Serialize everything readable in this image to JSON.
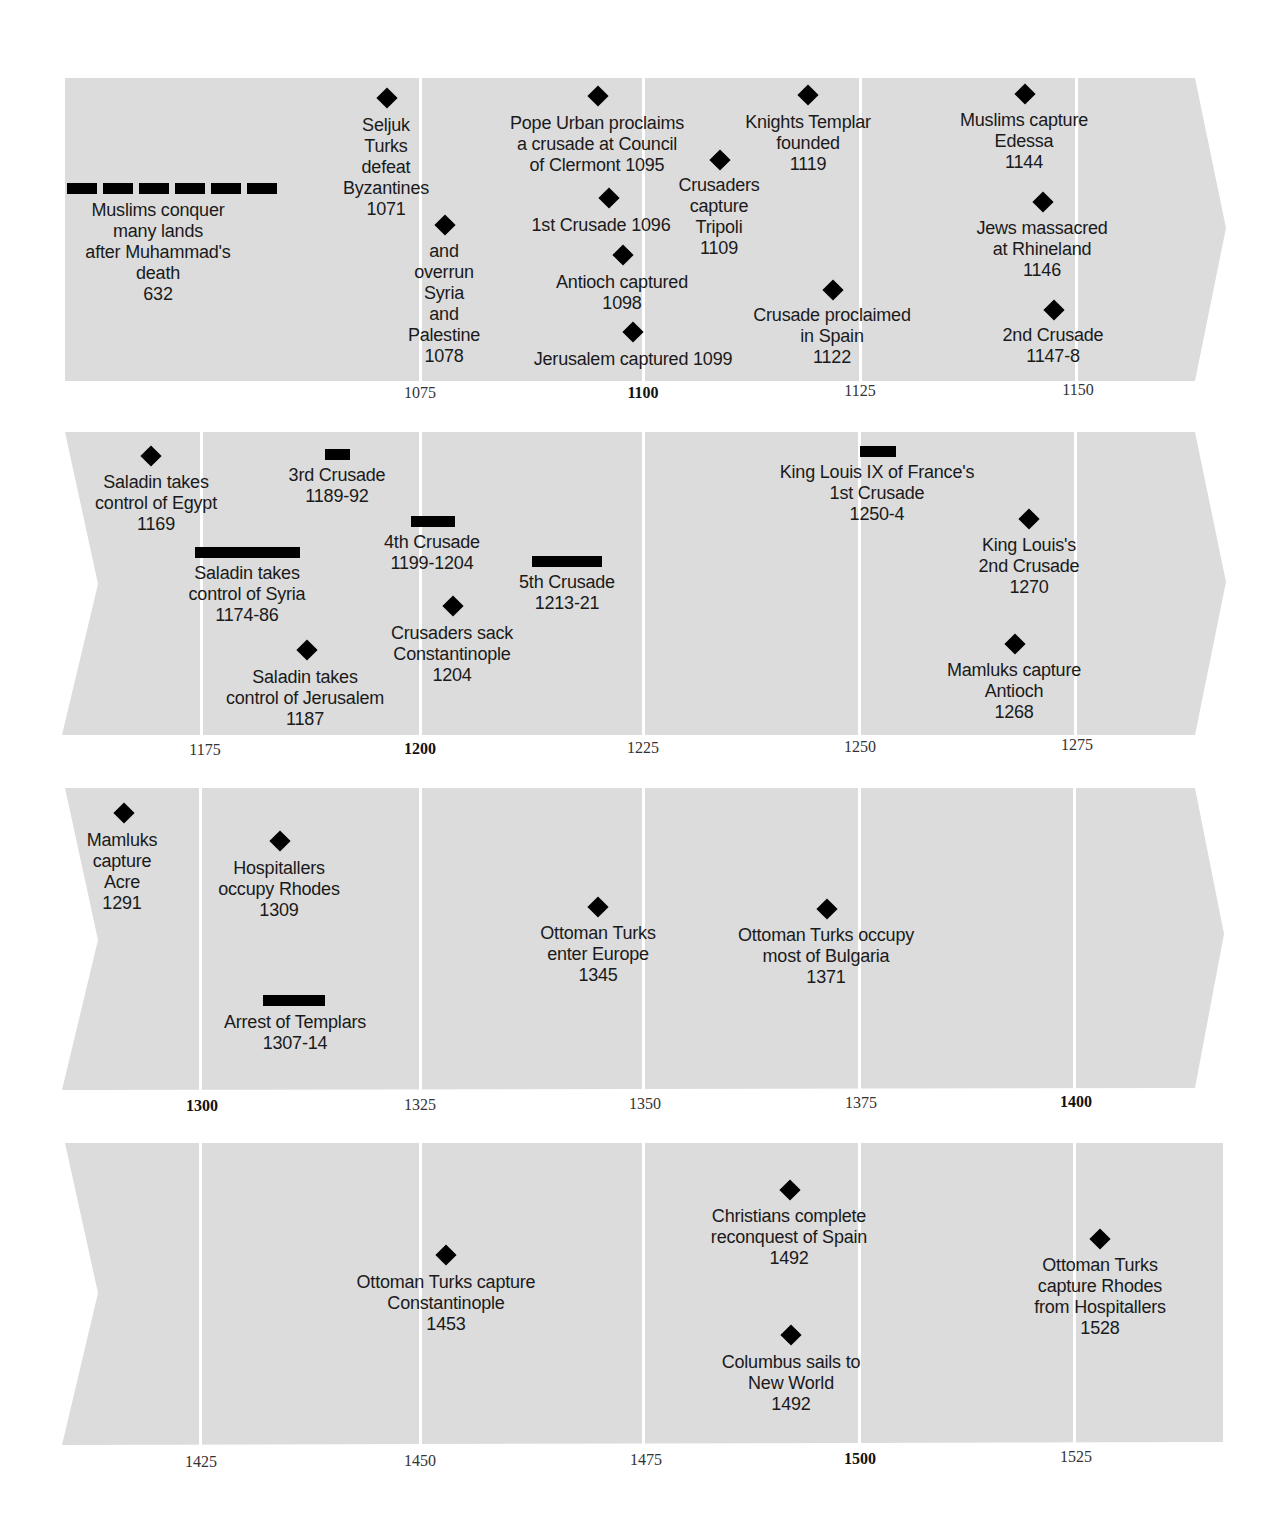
{
  "rows": [
    {
      "ticks": [
        {
          "label": "1075",
          "x": 420,
          "bold": false
        },
        {
          "label": "1100",
          "x": 643,
          "bold": true
        },
        {
          "label": "1125",
          "x": 860,
          "bold": false
        },
        {
          "label": "1150",
          "x": 1078,
          "bold": false
        }
      ],
      "events": [
        {
          "label": "Muslims conquer\nmany lands\nafter Muhammad's\ndeath\n632",
          "year": "632",
          "marker": "dashed-bar"
        },
        {
          "label": "Seljuk\nTurks\ndefeat\nByzantines\n1071",
          "year": "1071",
          "marker": "diamond"
        },
        {
          "label": "and\noverrun\nSyria\nand\nPalestine\n1078",
          "year": "1078",
          "marker": "diamond"
        },
        {
          "label": "Pope Urban proclaims\na crusade at Council\nof Clermont 1095",
          "year": "1095",
          "marker": "diamond"
        },
        {
          "label": "1st Crusade 1096",
          "year": "1096",
          "marker": "diamond"
        },
        {
          "label": "Antioch captured\n1098",
          "year": "1098",
          "marker": "diamond"
        },
        {
          "label": "Jerusalem captured 1099",
          "year": "1099",
          "marker": "diamond"
        },
        {
          "label": "Crusaders\ncapture\nTripoli\n1109",
          "year": "1109",
          "marker": "diamond"
        },
        {
          "label": "Knights Templar\nfounded\n1119",
          "year": "1119",
          "marker": "diamond"
        },
        {
          "label": "Crusade proclaimed\nin Spain\n1122",
          "year": "1122",
          "marker": "diamond"
        },
        {
          "label": "Muslims capture\nEdessa\n1144",
          "year": "1144",
          "marker": "diamond"
        },
        {
          "label": "Jews massacred\nat Rhineland\n1146",
          "year": "1146",
          "marker": "diamond"
        },
        {
          "label": "2nd Crusade\n1147-8",
          "year": "1147-8",
          "marker": "diamond"
        }
      ]
    },
    {
      "ticks": [
        {
          "label": "1175",
          "x": 205,
          "bold": false
        },
        {
          "label": "1200",
          "x": 420,
          "bold": true
        },
        {
          "label": "1225",
          "x": 643,
          "bold": false
        },
        {
          "label": "1250",
          "x": 860,
          "bold": false
        },
        {
          "label": "1275",
          "x": 1077,
          "bold": false
        }
      ],
      "events": [
        {
          "label": "Saladin takes\ncontrol of Egypt\n1169",
          "year": "1169",
          "marker": "diamond"
        },
        {
          "label": "3rd Crusade\n1189-92",
          "year": "1189-92",
          "marker": "bar"
        },
        {
          "label": "Saladin takes\ncontrol of Syria\n1174-86",
          "year": "1174-86",
          "marker": "bar"
        },
        {
          "label": "Saladin takes\ncontrol of Jerusalem\n1187",
          "year": "1187",
          "marker": "diamond"
        },
        {
          "label": "4th Crusade\n1199-1204",
          "year": "1199-1204",
          "marker": "bar"
        },
        {
          "label": "Crusaders sack\nConstantinople\n1204",
          "year": "1204",
          "marker": "diamond"
        },
        {
          "label": "5th Crusade\n1213-21",
          "year": "1213-21",
          "marker": "bar"
        },
        {
          "label": "King Louis IX of France's\n1st Crusade\n1250-4",
          "year": "1250-4",
          "marker": "bar"
        },
        {
          "label": "King Louis's\n2nd Crusade\n1270",
          "year": "1270",
          "marker": "diamond"
        },
        {
          "label": "Mamluks capture\nAntioch\n1268",
          "year": "1268",
          "marker": "diamond"
        }
      ]
    },
    {
      "ticks": [
        {
          "label": "1300",
          "x": 202,
          "bold": true
        },
        {
          "label": "1325",
          "x": 420,
          "bold": false
        },
        {
          "label": "1350",
          "x": 645,
          "bold": false
        },
        {
          "label": "1375",
          "x": 861,
          "bold": false
        },
        {
          "label": "1400",
          "x": 1076,
          "bold": true
        }
      ],
      "events": [
        {
          "label": "Mamluks\ncapture\nAcre\n1291",
          "year": "1291",
          "marker": "diamond"
        },
        {
          "label": "Hospitallers\noccupy Rhodes\n1309",
          "year": "1309",
          "marker": "diamond"
        },
        {
          "label": "Arrest of Templars\n1307-14",
          "year": "1307-14",
          "marker": "bar"
        },
        {
          "label": "Ottoman Turks\nenter Europe\n1345",
          "year": "1345",
          "marker": "diamond"
        },
        {
          "label": "Ottoman Turks occupy\nmost of Bulgaria\n1371",
          "year": "1371",
          "marker": "diamond"
        }
      ]
    },
    {
      "ticks": [
        {
          "label": "1425",
          "x": 201,
          "bold": false
        },
        {
          "label": "1450",
          "x": 420,
          "bold": false
        },
        {
          "label": "1475",
          "x": 646,
          "bold": false
        },
        {
          "label": "1500",
          "x": 860,
          "bold": true
        },
        {
          "label": "1525",
          "x": 1076,
          "bold": false
        }
      ],
      "events": [
        {
          "label": "Ottoman Turks capture\nConstantinople\n1453",
          "year": "1453",
          "marker": "diamond"
        },
        {
          "label": "Christians complete\nreconquest of Spain\n1492",
          "year": "1492",
          "marker": "diamond"
        },
        {
          "label": "Columbus sails to\nNew World\n1492",
          "year": "1492",
          "marker": "diamond"
        },
        {
          "label": "Ottoman Turks\ncapture Rhodes\nfrom Hospitallers\n1528",
          "year": "1528",
          "marker": "diamond"
        }
      ]
    }
  ],
  "colors": {
    "band": "#dcdcdc",
    "gridline": "#ffffff",
    "marker": "#000000",
    "text": "#1a1a1a"
  }
}
